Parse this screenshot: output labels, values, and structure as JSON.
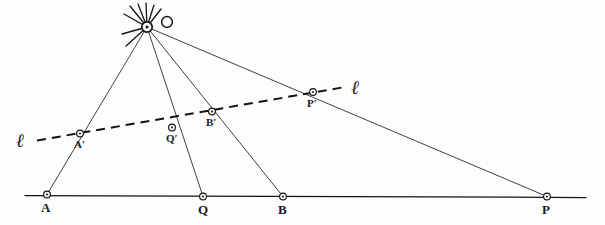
{
  "figure": {
    "center": {
      "name": "O",
      "label": "O",
      "x": 147,
      "y": 27
    },
    "line_labels": [
      {
        "name": "ell-left",
        "label": "ℓ",
        "x": 16,
        "y": 131
      },
      {
        "name": "ell-right",
        "label": "ℓ",
        "x": 351,
        "y": 78
      }
    ],
    "base_line": {
      "name": "base-line",
      "x1": 25,
      "y1": 195.5,
      "x2": 586,
      "y2": 197.5,
      "style": "solid"
    },
    "image_line": {
      "name": "image-line-ell",
      "x1": 37,
      "y1": 140.5,
      "x2": 345,
      "y2": 87.0,
      "style": "dashed",
      "dash": "9,6"
    },
    "rays": [
      {
        "name": "ray-OA",
        "x1": 147,
        "y1": 27,
        "x2": 47,
        "y2": 194.5
      },
      {
        "name": "ray-OQ",
        "x1": 147,
        "y1": 27,
        "x2": 203,
        "y2": 196.5
      },
      {
        "name": "ray-OB",
        "x1": 147,
        "y1": 27,
        "x2": 283,
        "y2": 196.5
      },
      {
        "name": "ray-OP",
        "x1": 147,
        "y1": 27,
        "x2": 547,
        "y2": 196.5
      }
    ],
    "points": [
      {
        "name": "point-A",
        "label": "A",
        "x": 47,
        "y": 194.5,
        "lx": 41,
        "ly": 201,
        "size": "big"
      },
      {
        "name": "point-Q",
        "label": "Q",
        "x": 203,
        "y": 196.5,
        "lx": 198,
        "ly": 203,
        "size": "big"
      },
      {
        "name": "point-B",
        "label": "B",
        "x": 283,
        "y": 196.5,
        "lx": 278,
        "ly": 203,
        "size": "big"
      },
      {
        "name": "point-P",
        "label": "P",
        "x": 547,
        "y": 196.5,
        "lx": 542,
        "ly": 203,
        "size": "big"
      },
      {
        "name": "point-A-prime",
        "label": "A′",
        "x": 80,
        "y": 133.5,
        "lx": 74,
        "ly": 139,
        "size": "small"
      },
      {
        "name": "point-Q-prime",
        "label": "Q′",
        "x": 172,
        "y": 127.5,
        "lx": 166,
        "ly": 133,
        "size": "small"
      },
      {
        "name": "point-B-prime",
        "label": "B′",
        "x": 212,
        "y": 111.5,
        "lx": 206,
        "ly": 117,
        "size": "small"
      },
      {
        "name": "point-P-prime",
        "label": "P′",
        "x": 313,
        "y": 92.0,
        "lx": 307,
        "ly": 98,
        "size": "small"
      }
    ],
    "center_hatches": [
      {
        "name": "hatch-1",
        "x1": 147,
        "y1": 27,
        "x2": 130,
        "y2": 6
      },
      {
        "name": "hatch-2",
        "x1": 147,
        "y1": 27,
        "x2": 138,
        "y2": 4
      },
      {
        "name": "hatch-3",
        "x1": 147,
        "y1": 27,
        "x2": 146,
        "y2": 3
      },
      {
        "name": "hatch-4",
        "x1": 147,
        "y1": 27,
        "x2": 154,
        "y2": 5
      },
      {
        "name": "hatch-5",
        "x1": 147,
        "y1": 27,
        "x2": 161,
        "y2": 9
      },
      {
        "name": "hatch-6",
        "x1": 147,
        "y1": 27,
        "x2": 124,
        "y2": 14
      },
      {
        "name": "hatch-7",
        "x1": 147,
        "y1": 27,
        "x2": 122,
        "y2": 34
      },
      {
        "name": "hatch-8",
        "x1": 147,
        "y1": 27,
        "x2": 126,
        "y2": 46
      }
    ],
    "colors": {
      "ink": "#2a2a2a",
      "ink_dark": "#141414",
      "paper": "#fdfdfc"
    }
  }
}
